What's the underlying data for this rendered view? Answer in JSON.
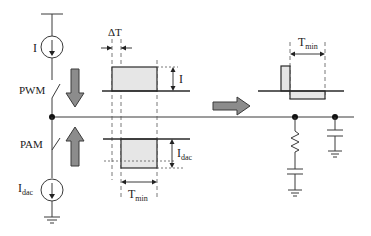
{
  "diagram": {
    "type": "circuit-timing-diagram",
    "labels": {
      "current_source_top": "I",
      "switch_top": "PWM",
      "switch_bottom": "PAM",
      "current_source_bottom_main": "I",
      "current_source_bottom_sub": "dac",
      "delta_t": "ΔT",
      "pulse_top_amplitude": "I",
      "pulse_bottom_amplitude_main": "I",
      "pulse_bottom_amplitude_sub": "dac",
      "tmin_bottom_main": "T",
      "tmin_bottom_sub": "min",
      "tmin_right_main": "T",
      "tmin_right_sub": "min"
    },
    "colors": {
      "wire": "#3a3a3a",
      "pulse_fill": "#e6e6e6",
      "arrow_fill": "#8c8c8c",
      "node": "#111111"
    }
  }
}
